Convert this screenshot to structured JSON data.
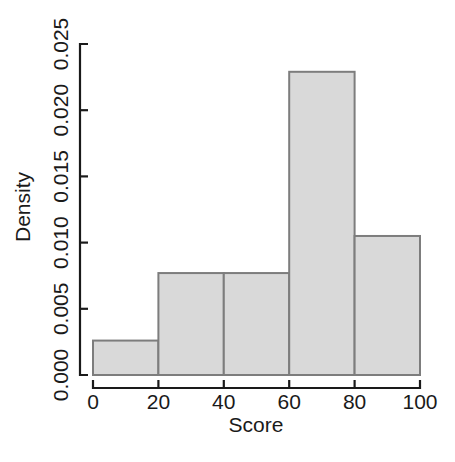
{
  "chart_data": {
    "type": "bar",
    "title": "",
    "subtitle": "",
    "xlabel": "Score",
    "ylabel": "Density",
    "xlim": [
      0,
      100
    ],
    "ylim": [
      0.0,
      0.025
    ],
    "grid": false,
    "legend": null,
    "bin_edges": [
      0,
      20,
      40,
      60,
      80,
      100
    ],
    "bin_width": 20,
    "categories": [
      "0-20",
      "20-40",
      "40-60",
      "60-80",
      "80-100"
    ],
    "values": [
      0.0026,
      0.0077,
      0.0077,
      0.0229,
      0.0105
    ],
    "xticks": [
      0,
      20,
      40,
      60,
      80,
      100
    ],
    "xtick_labels": [
      "0",
      "20",
      "40",
      "60",
      "80",
      "100"
    ],
    "yticks": [
      0.0,
      0.005,
      0.01,
      0.015,
      0.02,
      0.025
    ],
    "ytick_labels": [
      "0.000",
      "0.005",
      "0.010",
      "0.015",
      "0.020",
      "0.025"
    ],
    "bar_fill_color": "#d9d9d9",
    "bar_border_color": "#7d7d7d",
    "axis_color": "#1a1a1a",
    "background_color": "#ffffff"
  }
}
